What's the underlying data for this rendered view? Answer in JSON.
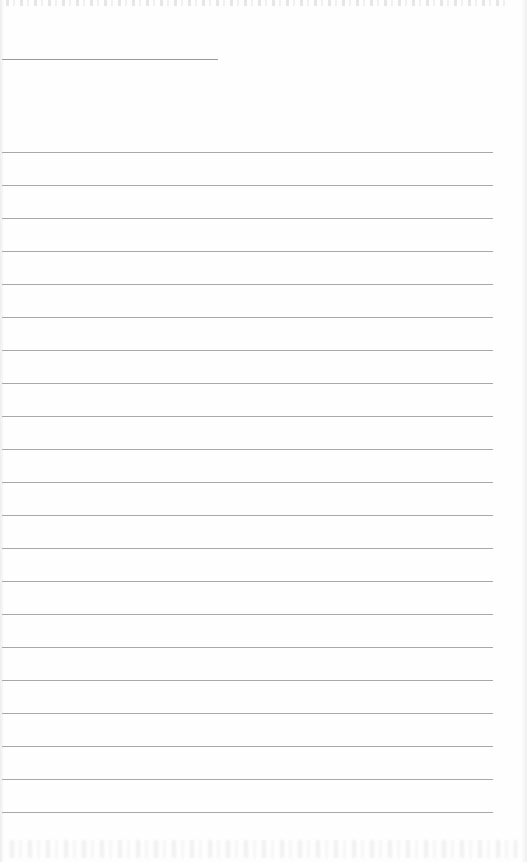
{
  "page": {
    "type": "lined-writing-page",
    "background_color": "#fefefe",
    "line_color": "#a8a8a8"
  },
  "header_line": {
    "x": 2,
    "y": 59,
    "width": 216
  },
  "ruled_lines": {
    "count": 21,
    "start_y": 152,
    "spacing": 33,
    "x": 2,
    "width": 491
  }
}
